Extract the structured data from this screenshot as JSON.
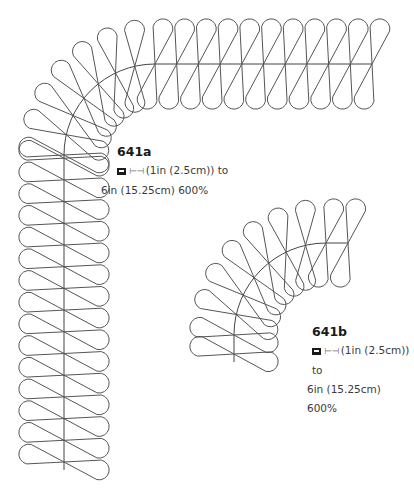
{
  "colors": {
    "stroke": "#555555",
    "spine": "#444444",
    "text": "#3a3a3a"
  },
  "patterns": [
    {
      "id": "641a",
      "title": "641a",
      "icon_machine": "sewing-machine-icon",
      "icon_width": "width-arrow-icon",
      "width_symbol": "⊢⊣",
      "line1": "(1in (2.5cm)) to",
      "line2": "6in (15.25cm) 600%",
      "geometry": {
        "arc_center": [
          155,
          155
        ],
        "radius": 91,
        "vertical_spine_x": 64,
        "vertical_from_y": 155,
        "vertical_to_y": 470,
        "horizontal_spine_y": 64,
        "horizontal_from_x": 155,
        "horizontal_to_x": 372,
        "pitch": 21.7,
        "half_len": 46,
        "lobe_w": 10
      }
    },
    {
      "id": "641b",
      "title": "641b",
      "icon_machine": "sewing-machine-icon",
      "icon_width": "width-arrow-icon",
      "width_symbol": "⊢⊣",
      "line1": "(1in (2.5cm)) to",
      "line2": "6in (15.25cm) 600%",
      "geometry": {
        "arc_center": [
          326,
          335
        ],
        "radius": 92,
        "vertical_spine_x": 234,
        "vertical_from_y": 335,
        "vertical_to_y": 362,
        "horizontal_spine_y": 243,
        "horizontal_from_x": 326,
        "horizontal_to_x": 348,
        "pitch": 22,
        "half_len": 45,
        "lobe_w": 10
      }
    }
  ]
}
